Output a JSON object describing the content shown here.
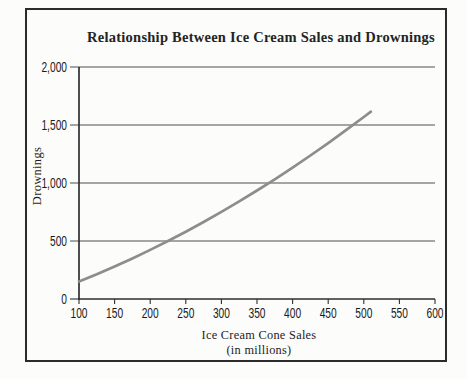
{
  "chart_data": {
    "type": "line",
    "title": "Relationship Between Ice Cream Sales and Drownings",
    "xlabel": "Ice Cream Cone Sales",
    "xlabel_sub": "(in millions)",
    "ylabel": "Drownings",
    "xlim": [
      100,
      600
    ],
    "ylim": [
      0,
      2000
    ],
    "x_ticks": [
      100,
      150,
      200,
      250,
      300,
      350,
      400,
      450,
      500,
      550,
      600
    ],
    "x_tick_labels": [
      "100",
      "150",
      "200",
      "250",
      "300",
      "350",
      "400",
      "450",
      "500",
      "550",
      "600"
    ],
    "y_ticks": [
      0,
      500,
      1000,
      1500,
      2000
    ],
    "y_tick_labels": [
      "0",
      "500",
      "1,000",
      "1,500",
      "2,000"
    ],
    "grid": "horizontal",
    "legend": "none",
    "series": [
      {
        "name": "Drownings vs. Ice Cream Cone Sales",
        "color": "#8d8d8d",
        "x": [
          100,
          125,
          150,
          175,
          200,
          225,
          250,
          275,
          300,
          325,
          350,
          375,
          400,
          425,
          450,
          475,
          500,
          510
        ],
        "y": [
          150,
          213,
          280,
          350,
          423,
          500,
          580,
          664,
          751,
          841,
          935,
          1032,
          1133,
          1237,
          1344,
          1455,
          1569,
          1615
        ]
      }
    ],
    "colors": {
      "frame": "#2b2b2b",
      "axis": "#2f2f2f",
      "grid": "#4f4f4f",
      "text": "#1d1d1d",
      "line": "#8d8d8d",
      "background": "#fcfcfa"
    }
  }
}
